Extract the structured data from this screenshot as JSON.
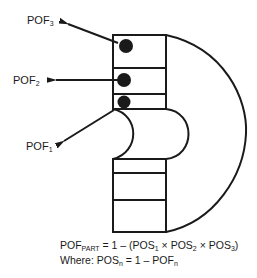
{
  "diagram": {
    "labels": [
      {
        "id": "pof3",
        "base": "POF",
        "sub": "3"
      },
      {
        "id": "pof2",
        "base": "POF",
        "sub": "2"
      },
      {
        "id": "pof1",
        "base": "POF",
        "sub": "1"
      }
    ],
    "formula": {
      "line1": {
        "lhs_base": "POF",
        "lhs_sub": "PART",
        "eq": " = 1 – (",
        "t1": "POS",
        "t1_sub": "1",
        "times1": " × ",
        "t2": "POS",
        "t2_sub": "2",
        "times2": " × ",
        "t3": "POS",
        "t3_sub": "3",
        "close": ")"
      },
      "line2": {
        "prefix": "Where: ",
        "lhs": "POS",
        "lhs_sub": "n",
        "eq": " = 1 – ",
        "rhs": "POF",
        "rhs_sub": "n"
      }
    },
    "colors": {
      "stroke": "#1a1a1a",
      "background": "#ffffff"
    }
  }
}
